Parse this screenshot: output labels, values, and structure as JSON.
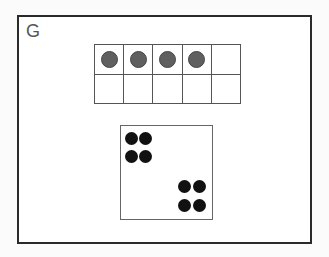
{
  "card": {
    "label": "G"
  },
  "ten_frame": {
    "rows": 2,
    "cols": 5,
    "filled_count": 4,
    "counter_color": "#5f5f5f",
    "cells": [
      [
        true,
        true,
        true,
        true,
        false
      ],
      [
        false,
        false,
        false,
        false,
        false
      ]
    ]
  },
  "dot_box": {
    "total_dots": 8,
    "groups": [
      {
        "position": "top-left",
        "dots": 4
      },
      {
        "position": "bottom-right",
        "dots": 4
      }
    ],
    "dot_color": "#111111"
  }
}
